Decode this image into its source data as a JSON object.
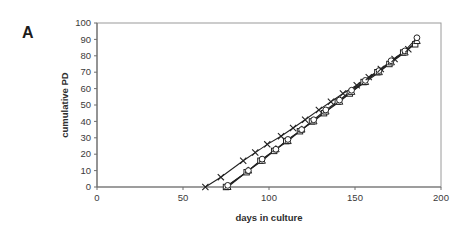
{
  "figure": {
    "panel_label": "A"
  },
  "chart_data": {
    "type": "line",
    "title": "",
    "xlabel": "days in culture",
    "ylabel": "cumulative PD",
    "xlim": [
      0,
      200
    ],
    "ylim": [
      0,
      100
    ],
    "x_ticks": [
      0,
      50,
      100,
      150,
      200
    ],
    "y_ticks": [
      0,
      10,
      20,
      30,
      40,
      50,
      60,
      70,
      80,
      90,
      100
    ],
    "grid": "off",
    "legend": "none",
    "plot_border": "box",
    "colors": {
      "line": "#222222",
      "marker_fill": "#ffffff",
      "box_border": "#9a9a9a",
      "axis": "#6f6f6f"
    },
    "series": [
      {
        "name": "square-culture",
        "marker": "square",
        "x": [
          75,
          87,
          95,
          103,
          110,
          118,
          125,
          132,
          140,
          147,
          155,
          163,
          170,
          178,
          185
        ],
        "y": [
          0,
          9,
          16,
          22,
          28,
          34,
          40,
          45,
          52,
          57,
          64,
          70,
          75,
          82,
          87
        ]
      },
      {
        "name": "triangle-culture",
        "marker": "triangle",
        "x": [
          76,
          88,
          96,
          104,
          111,
          119,
          126,
          133,
          141,
          148,
          156,
          164,
          171,
          179,
          186
        ],
        "y": [
          0,
          10,
          16,
          23,
          28,
          35,
          40,
          46,
          52,
          58,
          64,
          70,
          76,
          82,
          89
        ]
      },
      {
        "name": "circle-culture",
        "marker": "circle",
        "x": [
          76,
          88,
          96,
          104,
          111,
          119,
          126,
          133,
          141,
          148,
          156,
          164,
          171,
          179,
          186
        ],
        "y": [
          1,
          10,
          17,
          23,
          29,
          35,
          41,
          47,
          53,
          59,
          65,
          71,
          77,
          83,
          91
        ]
      },
      {
        "name": "x-culture",
        "marker": "x",
        "x": [
          63,
          72,
          85,
          92,
          99,
          107,
          114,
          121,
          129,
          136,
          143,
          151,
          158,
          165,
          173,
          181
        ],
        "y": [
          0,
          6,
          16,
          21,
          26,
          31,
          36,
          41,
          47,
          52,
          57,
          62,
          67,
          72,
          78,
          84
        ]
      }
    ]
  }
}
